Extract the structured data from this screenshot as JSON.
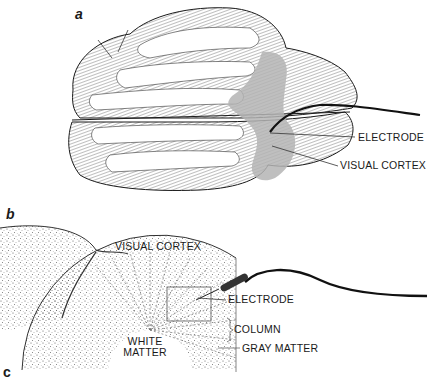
{
  "figure": {
    "panels": [
      {
        "id": "a",
        "label": "a",
        "description": "Dorsal view of brain with electrode inserted into shaded visual cortex"
      },
      {
        "id": "b",
        "label": "b",
        "description": "Cross-section of visual cortex showing columns, gray matter and white matter with electrode"
      },
      {
        "id": "c",
        "label": "c"
      }
    ],
    "panel_a": {
      "callouts": {
        "electrode": "ELECTRODE",
        "visual_cortex": "VISUAL CORTEX"
      }
    },
    "panel_b": {
      "callouts": {
        "visual_cortex": "VISUAL CORTEX",
        "electrode": "ELECTRODE",
        "column": "COLUMN",
        "gray_matter": "GRAY MATTER",
        "white_matter_line1": "WHITE",
        "white_matter_line2": "MATTER"
      }
    },
    "colors": {
      "ink": "#1a1a1a",
      "visual_cortex_shade": "#b4b4b4",
      "hatch": "#6e6e6e",
      "stipple": "#555555",
      "background": "#ffffff"
    }
  }
}
